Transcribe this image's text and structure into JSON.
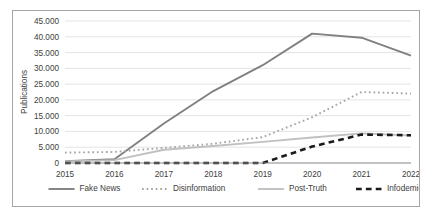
{
  "chart_data": {
    "type": "line",
    "title": "",
    "xlabel": "",
    "ylabel": "Publications",
    "categories": [
      "2015",
      "2016",
      "2017",
      "2018",
      "2019",
      "2020",
      "2021",
      "2022"
    ],
    "ylim": [
      0,
      45000
    ],
    "ytick_values": [
      0,
      5000,
      10000,
      15000,
      20000,
      25000,
      30000,
      35000,
      40000,
      45000
    ],
    "ytick_labels": [
      "0",
      "5.000",
      "10.000",
      "15.000",
      "20.000",
      "25.000",
      "30.000",
      "35.000",
      "40.000",
      "45.000"
    ],
    "grid": true,
    "legend_position": "bottom",
    "series": [
      {
        "name": "Fake News",
        "style": "solid",
        "color": "#808080",
        "values": [
          600,
          1200,
          12500,
          22800,
          31000,
          41000,
          39700,
          34000
        ]
      },
      {
        "name": "Disinformation",
        "style": "dotted",
        "color": "#a6a6a6",
        "values": [
          3300,
          3500,
          4800,
          6100,
          8200,
          14500,
          22500,
          22000
        ]
      },
      {
        "name": "Post-Truth",
        "style": "solid",
        "color": "#c0c0c0",
        "values": [
          500,
          900,
          4200,
          5400,
          6700,
          8100,
          9400,
          8700
        ]
      },
      {
        "name": "Infodemic",
        "style": "dashed",
        "color": "#1a1a1a",
        "values": [
          0,
          0,
          0,
          0,
          0,
          5200,
          9000,
          8800
        ]
      }
    ]
  },
  "axis": {
    "y_title": "Publications"
  }
}
